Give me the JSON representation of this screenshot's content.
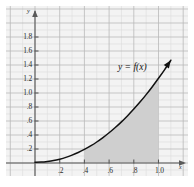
{
  "figure": {
    "name": "graph-of-function-with-shaded-region",
    "background_color": "#f3f3f3",
    "page_color": "#ffffff"
  },
  "axes": {
    "x_axis_name": "x",
    "y_axis_name": "y",
    "x_label_positions": [
      0.2,
      0.4,
      0.6,
      0.8,
      1.0
    ],
    "x_tick_labels": [
      ".2",
      ".4",
      ".6",
      ".8",
      "1.0"
    ],
    "y_label_positions": [
      0.2,
      0.4,
      0.6,
      0.8,
      1.0,
      1.2,
      1.4,
      1.6,
      1.8
    ],
    "y_tick_labels": [
      ".2",
      ".4",
      ".6",
      ".8",
      "1.0",
      "1.2",
      "1.4",
      "1.6",
      "1.8"
    ],
    "axis_color": "#5a5a5a",
    "grid_major_color": "#b9b9b9",
    "grid_minor_color": "#dcdcdc",
    "grid_major_step": 0.2,
    "grid_minor_step": 0.1
  },
  "chart_data": {
    "type": "line",
    "title": "",
    "xlabel": "x",
    "ylabel": "y",
    "xlim": [
      -0.1,
      1.18
    ],
    "ylim": [
      -0.12,
      1.95
    ],
    "grid": true,
    "legend": "none",
    "annotations": [
      {
        "text": "y = f(x)",
        "x": 0.78,
        "y": 1.33
      }
    ],
    "series": [
      {
        "name": "y = f(x)",
        "color": "#111111",
        "arrow_end": true,
        "x": [
          0.0,
          0.05,
          0.1,
          0.15,
          0.2,
          0.25,
          0.3,
          0.35,
          0.4,
          0.45,
          0.5,
          0.55,
          0.6,
          0.65,
          0.7,
          0.75,
          0.8,
          0.85,
          0.9,
          0.95,
          1.0,
          1.05,
          1.1
        ],
        "y": [
          0.01,
          0.013,
          0.022,
          0.035,
          0.055,
          0.08,
          0.112,
          0.15,
          0.194,
          0.244,
          0.3,
          0.363,
          0.432,
          0.507,
          0.588,
          0.676,
          0.77,
          0.87,
          0.977,
          1.09,
          1.21,
          1.335,
          1.468
        ]
      }
    ],
    "shaded_region": {
      "name": "area-under-curve",
      "fill_color": "#cfcfcf",
      "x_start": 0.4,
      "x_end": 1.0,
      "description": "region bounded below by the x-axis, above by y = f(x), left by x = .4 and right by x = 1.0"
    }
  }
}
